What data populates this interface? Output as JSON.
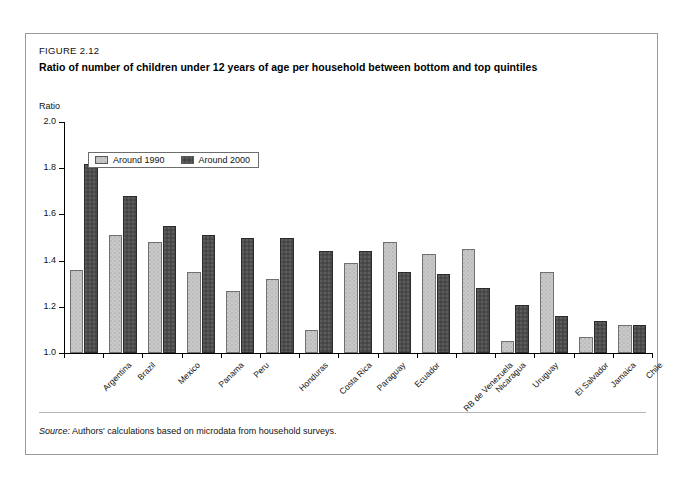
{
  "figure": {
    "label": "FIGURE 2.12",
    "title": "Ratio of number of children under 12 years of age per household between bottom and top quintiles",
    "source_keyword": "Source:",
    "source_text": "Authors' calculations based on microdata from household surveys."
  },
  "colors": {
    "series_1990": "#c9c9c9",
    "series_2000": "#4d4d4d",
    "axis": "#000000",
    "frame_border": "#9a9a9a"
  },
  "chart_data": {
    "type": "bar",
    "title": "Ratio of number of children under 12 years of age per household between bottom and top quintiles",
    "xlabel": "",
    "ylabel": "Ratio",
    "ylim": [
      1.0,
      2.0
    ],
    "yticks": [
      "1.0",
      "1.2",
      "1.4",
      "1.6",
      "1.8",
      "2.0"
    ],
    "ytick_values": [
      1.0,
      1.2,
      1.4,
      1.6,
      1.8,
      2.0
    ],
    "grid": false,
    "legend_position": "top-left",
    "categories": [
      "Argentina",
      "Brazil",
      "Mexico",
      "Panama",
      "Peru",
      "Honduras",
      "Costa Rica",
      "Paraguay",
      "Ecuador",
      "RB de Venezuela",
      "Nicaragua",
      "Uruguay",
      "El Salvador",
      "Jamaica",
      "Chile"
    ],
    "series": [
      {
        "name": "Around 1990",
        "color": "#c9c9c9",
        "values": [
          1.36,
          1.51,
          1.48,
          1.35,
          1.27,
          1.32,
          1.1,
          1.39,
          1.48,
          1.43,
          1.45,
          1.05,
          1.35,
          1.07,
          1.12
        ]
      },
      {
        "name": "Around 2000",
        "color": "#4d4d4d",
        "values": [
          1.82,
          1.68,
          1.55,
          1.51,
          1.5,
          1.5,
          1.44,
          1.44,
          1.35,
          1.34,
          1.28,
          1.21,
          1.16,
          1.14,
          1.12
        ]
      }
    ]
  }
}
